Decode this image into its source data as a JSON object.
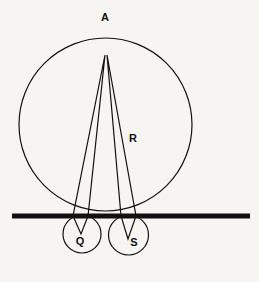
{
  "figure": {
    "type": "geometry-diagram",
    "canvas": {
      "width": 259,
      "height": 282
    },
    "background_color": "#f6f5f2",
    "stroke_color": "#111111"
  },
  "labels": {
    "apex": "A",
    "large_circle": "R",
    "small_circle_left": "Q",
    "small_circle_right": "S"
  },
  "label_positions": {
    "apex": {
      "x": 105,
      "y": 18
    },
    "large_circle": {
      "x": 133,
      "y": 139
    },
    "small_circle_left": {
      "x": 80,
      "y": 242
    },
    "small_circle_right": {
      "x": 134,
      "y": 243
    }
  },
  "shapes": {
    "large_circle": {
      "name": "R",
      "cx": 105.5,
      "cy": 124.5,
      "r": 86.5,
      "stroke_width": 1.2,
      "fill": "none"
    },
    "small_circle_left": {
      "name": "Q",
      "cx": 82,
      "cy": 234,
      "r": 19,
      "stroke_width": 1.2,
      "fill": "none"
    },
    "small_circle_right": {
      "name": "S",
      "cx": 128.5,
      "cy": 235,
      "r": 20,
      "stroke_width": 1.2,
      "fill": "none"
    },
    "baseline": {
      "name": "tangent-line",
      "x1": 12,
      "y1": 216,
      "x2": 250,
      "y2": 216,
      "stroke_width": 5
    },
    "wedge_left": {
      "name": "apex-to-Q-wedge",
      "apex": {
        "x": 105,
        "y": 55
      },
      "tip": {
        "x": 81,
        "y": 234
      },
      "left_base": {
        "x": 73,
        "y": 216
      },
      "right_base": {
        "x": 88,
        "y": 216
      },
      "stroke_width": 1.2
    },
    "wedge_right": {
      "name": "apex-to-S-wedge",
      "apex": {
        "x": 107,
        "y": 55
      },
      "tip": {
        "x": 128,
        "y": 239
      },
      "left_base": {
        "x": 121,
        "y": 216
      },
      "right_base": {
        "x": 136,
        "y": 216
      },
      "stroke_width": 1.2
    }
  }
}
